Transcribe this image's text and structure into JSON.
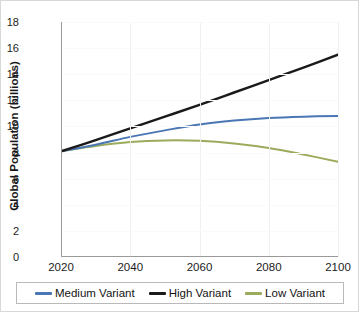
{
  "chart_data": {
    "type": "line",
    "title": "",
    "xlabel": "",
    "ylabel": "Global Population (billions)",
    "xlim": [
      2020,
      2100
    ],
    "ylim": [
      0,
      18
    ],
    "grid": true,
    "legend_position": "bottom",
    "x": [
      2020,
      2030,
      2040,
      2050,
      2060,
      2070,
      2080,
      2090,
      2100
    ],
    "xticks": [
      "2020",
      "2040",
      "2060",
      "2080",
      "2100"
    ],
    "yticks": [
      "0",
      "2",
      "4",
      "6",
      "8",
      "10",
      "12",
      "14",
      "16",
      "18"
    ],
    "series": [
      {
        "name": "Medium Variant",
        "color": "#4a77b4",
        "values": [
          8.1,
          8.6,
          9.2,
          9.7,
          10.15,
          10.45,
          10.65,
          10.75,
          10.8
        ]
      },
      {
        "name": "High Variant",
        "color": "#1a1a1a",
        "values": [
          8.1,
          8.95,
          9.85,
          10.75,
          11.65,
          12.6,
          13.55,
          14.5,
          15.5
        ]
      },
      {
        "name": "Low Variant",
        "color": "#9bab5c",
        "values": [
          8.1,
          8.5,
          8.8,
          8.93,
          8.9,
          8.7,
          8.35,
          7.85,
          7.3
        ]
      }
    ]
  },
  "legend": {
    "items": [
      {
        "label": "Medium Variant",
        "color": "#4a77b4"
      },
      {
        "label": "High Variant",
        "color": "#1a1a1a"
      },
      {
        "label": "Low Variant",
        "color": "#9bab5c"
      }
    ]
  }
}
